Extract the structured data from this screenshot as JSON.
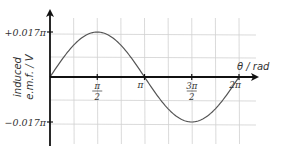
{
  "chart_data": {
    "type": "line",
    "title": "",
    "xlabel": "θ / rad",
    "ylabel": [
      "induced",
      "e.m.f. / V"
    ],
    "x_ticks": [
      {
        "value": 1.5708,
        "label_num": "π",
        "label_den": "2"
      },
      {
        "value": 3.1416,
        "label": "π"
      },
      {
        "value": 4.7124,
        "label_num": "3π",
        "label_den": "2"
      },
      {
        "value": 6.2832,
        "label": "2π"
      }
    ],
    "y_ticks": [
      {
        "value": 0.017,
        "label": "+0.017π"
      },
      {
        "value": -0.017,
        "label": "−0.017π"
      }
    ],
    "xlim": [
      0,
      6.6
    ],
    "ylim": [
      -0.024,
      0.024
    ],
    "grid": true,
    "series": [
      {
        "name": "induced e.m.f.",
        "function": "0.017π·sin(θ)",
        "x": [
          0,
          0.785,
          1.5708,
          2.356,
          3.1416,
          3.927,
          4.7124,
          5.498,
          6.2832
        ],
        "values": [
          0,
          0.012,
          0.017,
          0.012,
          0,
          -0.012,
          -0.017,
          -0.012,
          0
        ]
      }
    ],
    "colors": {
      "axis": "#111111",
      "grid": "#d0d0d0",
      "curve": "#555555"
    }
  }
}
